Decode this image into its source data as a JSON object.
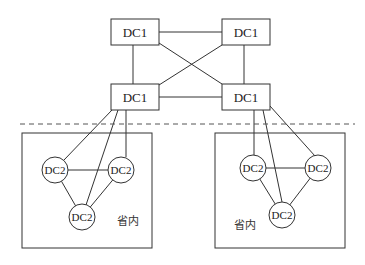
{
  "diagram": {
    "core_nodes": [
      {
        "id": "dc1-top-left",
        "label": "DC1",
        "x": 111,
        "y": 19,
        "w": 48,
        "h": 26
      },
      {
        "id": "dc1-top-right",
        "label": "DC1",
        "x": 222,
        "y": 19,
        "w": 48,
        "h": 26
      },
      {
        "id": "dc1-bottom-left",
        "label": "DC1",
        "x": 111,
        "y": 84,
        "w": 48,
        "h": 26
      },
      {
        "id": "dc1-bottom-right",
        "label": "DC1",
        "x": 222,
        "y": 84,
        "w": 48,
        "h": 26
      }
    ],
    "regions": [
      {
        "id": "province-left",
        "label": "省内",
        "nodes": [
          {
            "id": "dc2-l1",
            "label": "DC2"
          },
          {
            "id": "dc2-l2",
            "label": "DC2"
          },
          {
            "id": "dc2-l3",
            "label": "DC2"
          }
        ]
      },
      {
        "id": "province-right",
        "label": "省内",
        "nodes": [
          {
            "id": "dc2-r1",
            "label": "DC2"
          },
          {
            "id": "dc2-r2",
            "label": "DC2"
          },
          {
            "id": "dc2-r3",
            "label": "DC2"
          }
        ]
      }
    ],
    "separator": "dashed"
  }
}
